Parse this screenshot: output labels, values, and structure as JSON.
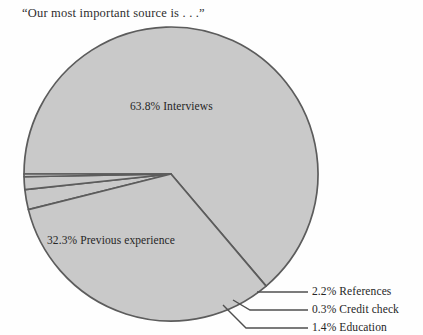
{
  "chart_data": {
    "type": "pie",
    "title": "“Our most important source is . . .”",
    "categories": [
      "Interviews",
      "Previous experience",
      "References",
      "Education",
      "Credit check"
    ],
    "values": [
      63.8,
      32.3,
      2.2,
      1.4,
      0.3
    ],
    "value_unit": "%",
    "labels": [
      "63.8% Interviews",
      "32.3% Previous experience",
      "2.2% References",
      "0.3% Credit check",
      "1.4% Education"
    ],
    "legend": "none",
    "grid": false,
    "xlabel": "",
    "ylabel": "",
    "colors": {
      "slice_fill": "#c9c9c9",
      "slice_outline": "#5c5c5c",
      "background": "#fefefe",
      "text": "#262626",
      "leader_line": "#4f4f4f"
    },
    "geometry": {
      "center_x": 171,
      "center_y": 174,
      "radius": 147,
      "start_angle_deg": 180,
      "direction": "clockwise"
    }
  },
  "title": {
    "text": "“Our most important source is . . .”"
  },
  "slice_labels": {
    "interviews": "63.8% Interviews",
    "previous_experience": "32.3% Previous experience"
  },
  "callouts": {
    "references": "2.2% References",
    "credit_check": "0.3% Credit check",
    "education": "1.4% Education"
  }
}
